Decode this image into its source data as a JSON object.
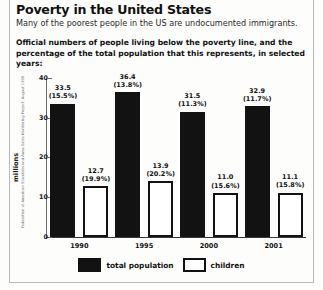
{
  "header": {
    "title": "Poverty in the United States",
    "subtitle": "Many of the poorest people in the US are undocumented immigrants.",
    "lede": "Official numbers of people living below the poverty line, and the percentage of the total population that this represents, in selected years:"
  },
  "credit": "Federation of American Scientists and Arms Sales Monitoring Project, August 1998",
  "chart_data": {
    "type": "bar",
    "title": "Poverty in the United States",
    "xlabel": "",
    "ylabel": "millions",
    "ylim": [
      0,
      40
    ],
    "yticks": [
      0,
      10,
      20,
      30,
      40
    ],
    "grid": false,
    "legend_position": "bottom",
    "categories": [
      "1990",
      "1995",
      "2000",
      "2001"
    ],
    "series": [
      {
        "name": "total population",
        "color": "#121212",
        "values": [
          33.5,
          36.4,
          31.5,
          32.9
        ],
        "percents": [
          "15.5%",
          "13.8%",
          "11.3%",
          "11.7%"
        ],
        "labels": [
          "33.5",
          "36.4",
          "31.5",
          "32.9"
        ],
        "percent_labels": [
          "(15.5%)",
          "(13.8%)",
          "(11.3%)",
          "(11.7%)"
        ]
      },
      {
        "name": "children",
        "color": "#ffffff",
        "values": [
          12.7,
          13.9,
          11.0,
          11.1
        ],
        "percents": [
          "19.9%",
          "20.2%",
          "15.6%",
          "15.8%"
        ],
        "labels": [
          "12.7",
          "13.9",
          "11.0",
          "11.1"
        ],
        "percent_labels": [
          "(19.9%)",
          "(20.2%)",
          "(15.6%)",
          "(15.8%)"
        ]
      }
    ]
  },
  "legend": {
    "items": [
      {
        "label": "total population"
      },
      {
        "label": "children"
      }
    ]
  }
}
